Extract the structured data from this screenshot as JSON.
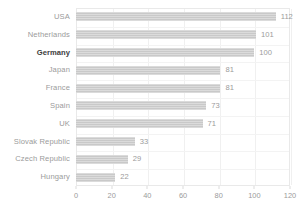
{
  "chart_data": {
    "type": "bar",
    "orientation": "horizontal",
    "title": "",
    "subtitle": "",
    "xlabel": "",
    "ylabel": "",
    "categories": [
      "USA",
      "Netherlands",
      "Germany",
      "Japan",
      "France",
      "Spain",
      "UK",
      "Slovak Republic",
      "Czech Republic",
      "Hungary"
    ],
    "values": [
      112,
      101,
      100,
      81,
      81,
      73,
      71,
      33,
      29,
      22
    ],
    "value_labels": [
      "112",
      "101",
      "100",
      "81",
      "81",
      "73",
      "71",
      "33",
      "29",
      "22"
    ],
    "highlight_category": "Germany",
    "xlim": [
      0,
      120
    ],
    "xticks": [
      0,
      20,
      40,
      60,
      80,
      100,
      120
    ],
    "xtick_labels": [
      "0",
      "20",
      "40",
      "60",
      "80",
      "100",
      "120"
    ],
    "grid": true,
    "legend": false,
    "colors": {
      "bar": "#c9c9c9",
      "label": "#9b9b9b",
      "highlight_label": "#3d3d3d",
      "grid": "#f0f0f0",
      "border": "#e9e9e9",
      "background": "#ffffff"
    }
  }
}
